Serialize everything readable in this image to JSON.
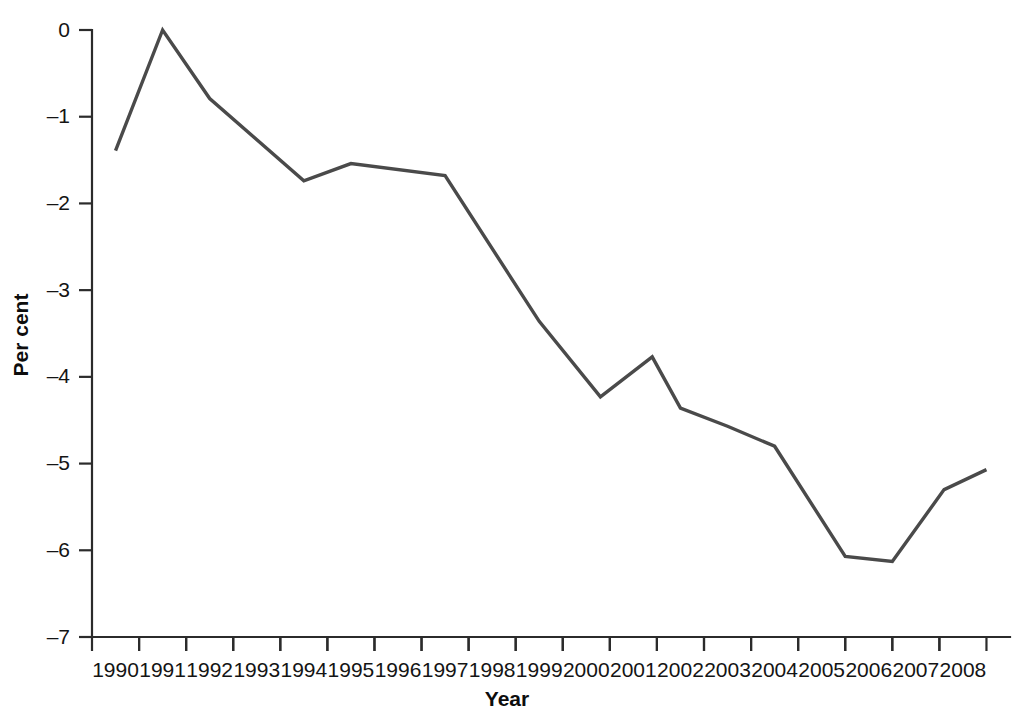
{
  "chart_data": {
    "type": "line",
    "title": "",
    "xlabel": "Year",
    "ylabel": "Per cent",
    "xlim": [
      1989.5,
      2009.0
    ],
    "ylim": [
      -7,
      0
    ],
    "grid": false,
    "legend": "none",
    "line_color": "#4a4a4a",
    "axis_color": "#2b2b2b",
    "y_ticks": [
      0,
      -1,
      -2,
      -3,
      -4,
      -5,
      -6,
      -7
    ],
    "y_tick_labels": [
      "0",
      "–1",
      "–2",
      "–3",
      "–4",
      "–5",
      "–6",
      "–7"
    ],
    "x_ticks": [
      1990,
      1991,
      1992,
      1993,
      1994,
      1995,
      1996,
      1997,
      1998,
      1999,
      2000,
      2001,
      2002,
      2003,
      2004,
      2005,
      2006,
      2007,
      2008
    ],
    "x_tick_labels": [
      "1990",
      "1991",
      "1992",
      "1993",
      "1994",
      "1995",
      "1996",
      "1997",
      "1998",
      "1999",
      "2000",
      "2001",
      "2002",
      "2003",
      "2004",
      "2005",
      "2006",
      "2007",
      "2008"
    ],
    "x_minor_ticks": [
      1990.5,
      1991.5,
      1992.5,
      1993.5,
      1994.5,
      1995.5,
      1996.5,
      1997.5,
      1998.5,
      1999.5,
      2000.5,
      2001.5,
      2002.5,
      2003.5,
      2004.5,
      2005.5,
      2006.5,
      2007.5,
      2008.5
    ],
    "x": [
      1990.0,
      1991.0,
      1992.0,
      1994.0,
      1995.0,
      1997.0,
      1999.0,
      2000.3,
      2001.4,
      2002.0,
      2003.0,
      2004.0,
      2005.5,
      2006.5,
      2007.6,
      2008.5
    ],
    "values": [
      -1.39,
      0.0,
      -0.79,
      -1.74,
      -1.54,
      -1.68,
      -3.36,
      -4.23,
      -3.77,
      -4.36,
      -4.57,
      -4.8,
      -6.07,
      -6.13,
      -5.3,
      -5.07
    ],
    "series": [
      {
        "name": "Per cent",
        "x": [
          1990.0,
          1991.0,
          1992.0,
          1994.0,
          1995.0,
          1997.0,
          1999.0,
          2000.3,
          2001.4,
          2002.0,
          2003.0,
          2004.0,
          2005.5,
          2006.5,
          2007.6,
          2008.5
        ],
        "values": [
          -1.39,
          0.0,
          -0.79,
          -1.74,
          -1.54,
          -1.68,
          -3.36,
          -4.23,
          -3.77,
          -4.36,
          -4.57,
          -4.8,
          -6.07,
          -6.13,
          -5.3,
          -5.07
        ]
      }
    ]
  }
}
